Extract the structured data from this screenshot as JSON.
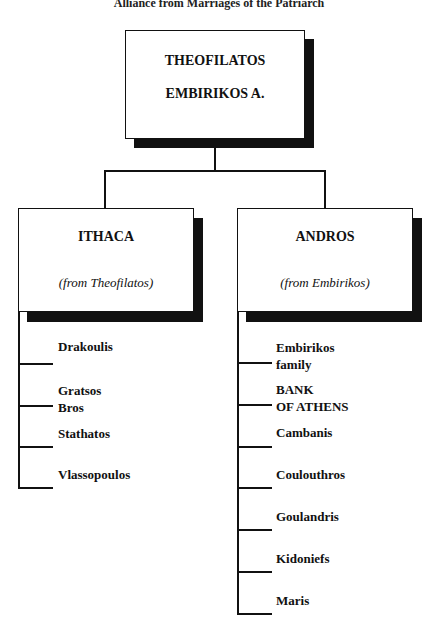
{
  "caption": "Alliance from Marriages of the Patriarch",
  "root": {
    "line1": "THEOFILATOS",
    "line2": "EMBIRIKOS A."
  },
  "branches": [
    {
      "title": "ITHACA",
      "subtitle": "(from Theofilatos)",
      "items": [
        {
          "line1": "Drakoulis",
          "line2": ""
        },
        {
          "line1": "Gratsos",
          "line2": "Bros"
        },
        {
          "line1": "Stathatos",
          "line2": ""
        },
        {
          "line1": "Vlassopoulos",
          "line2": ""
        }
      ]
    },
    {
      "title": "ANDROS",
      "subtitle": "(from Embirikos)",
      "items": [
        {
          "line1": "Embirikos",
          "line2": "family"
        },
        {
          "line1": "BANK",
          "line2": "OF ATHENS"
        },
        {
          "line1": "Cambanis",
          "line2": ""
        },
        {
          "line1": "Coulouthros",
          "line2": ""
        },
        {
          "line1": "Goulandris",
          "line2": ""
        },
        {
          "line1": "Kidoniefs",
          "line2": ""
        },
        {
          "line1": "Maris",
          "line2": ""
        }
      ]
    }
  ]
}
